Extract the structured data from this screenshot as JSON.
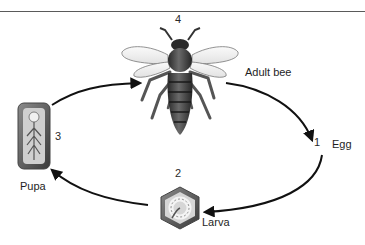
{
  "stages": [
    {
      "number": "1",
      "label": "Egg"
    },
    {
      "number": "2",
      "label": "Larva"
    },
    {
      "number": "3",
      "label": "Pupa"
    },
    {
      "number": "4",
      "label": "Adult bee"
    }
  ],
  "colors": {
    "arrow": "#111111",
    "line": "#5a5a5a",
    "text": "#1e1e1e"
  }
}
